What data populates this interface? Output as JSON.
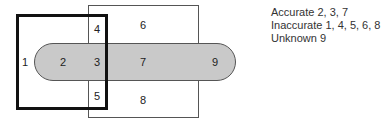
{
  "diagram": {
    "regions": [
      {
        "id": "1",
        "x": 25,
        "y": 62
      },
      {
        "id": "2",
        "x": 63,
        "y": 62
      },
      {
        "id": "3",
        "x": 97,
        "y": 62
      },
      {
        "id": "4",
        "x": 97,
        "y": 29
      },
      {
        "id": "5",
        "x": 97,
        "y": 96
      },
      {
        "id": "6",
        "x": 143,
        "y": 25
      },
      {
        "id": "7",
        "x": 143,
        "y": 62
      },
      {
        "id": "8",
        "x": 143,
        "y": 100
      },
      {
        "id": "9",
        "x": 215,
        "y": 62
      }
    ],
    "colors": {
      "pill_fill": "#c9c9c9",
      "thick_border": "#111111",
      "thin_border": "#555555"
    }
  },
  "legend": {
    "accurate": "Accurate 2, 3, 7",
    "inaccurate": "Inaccurate 1, 4, 5, 6, 8",
    "unknown": "Unknown 9"
  }
}
